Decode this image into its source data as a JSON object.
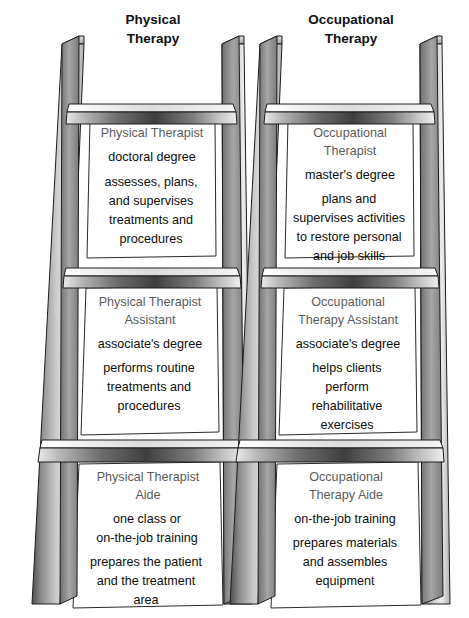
{
  "diagram": {
    "kind": "career-ladder-comparison",
    "background": "#ffffff",
    "title_color": "#5b5b5b",
    "body_color": "#0d0d0d",
    "heading_color": "#111111",
    "rail_light": "#f2f2f2",
    "rail_mid": "#b4b4b4",
    "rail_dark": "#4a4a4a",
    "rung_dark": "#3d3d3d",
    "outline": "#1a1a1a"
  },
  "ladders": [
    {
      "id": "physical-therapy",
      "heading_line1": "Physical",
      "heading_line2": "Therapy",
      "steps": [
        {
          "id": "physical-therapist",
          "level": "top",
          "title": [
            "Physical Therapist"
          ],
          "credential": [
            "doctoral degree"
          ],
          "duties": [
            "assesses, plans,",
            "and supervises",
            "treatments and",
            "procedures"
          ]
        },
        {
          "id": "physical-therapist-assistant",
          "level": "middle",
          "title": [
            "Physical Therapist",
            "Assistant"
          ],
          "credential": [
            "associate's degree"
          ],
          "duties": [
            "performs routine",
            "treatments and",
            "procedures"
          ]
        },
        {
          "id": "physical-therapist-aide",
          "level": "bottom",
          "title": [
            "Physical Therapist",
            "Aide"
          ],
          "credential": [
            "one class or",
            "on-the-job training"
          ],
          "duties": [
            "prepares the patient",
            "and the treatment",
            "area"
          ]
        }
      ]
    },
    {
      "id": "occupational-therapy",
      "heading_line1": "Occupational",
      "heading_line2": "Therapy",
      "steps": [
        {
          "id": "occupational-therapist",
          "level": "top",
          "title": [
            "Occupational",
            "Therapist"
          ],
          "credential": [
            "master's degree"
          ],
          "duties": [
            "plans and",
            "supervises activities",
            "to restore personal",
            "and job skills"
          ]
        },
        {
          "id": "occupational-therapy-assistant",
          "level": "middle",
          "title": [
            "Occupational",
            "Therapy Assistant"
          ],
          "credential": [
            "associate's degree"
          ],
          "duties": [
            "helps clients",
            "perform",
            "rehabilitative",
            "exercises"
          ]
        },
        {
          "id": "occupational-therapy-aide",
          "level": "bottom",
          "title": [
            "Occupational",
            "Therapy Aide"
          ],
          "credential": [
            "on-the-job training"
          ],
          "duties": [
            "prepares materials",
            "and assembles",
            "equipment"
          ]
        }
      ]
    }
  ]
}
